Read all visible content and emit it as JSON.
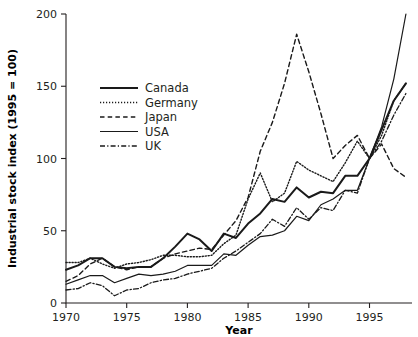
{
  "chart_data": {
    "type": "line",
    "title": "",
    "xlabel": "Year",
    "ylabel": "Industrial stock index (1995 = 100)",
    "xlim": [
      1970,
      1998.5
    ],
    "ylim": [
      0,
      200
    ],
    "xticks": [
      1970,
      1975,
      1980,
      1985,
      1990,
      1995
    ],
    "xtick_labels": [
      "1970",
      "1975",
      "1980",
      "1985",
      "1990",
      "1995"
    ],
    "yticks": [
      0,
      50,
      100,
      150,
      200
    ],
    "ytick_labels": [
      "0",
      "50",
      "100",
      "150",
      "200"
    ],
    "grid": false,
    "legend_position": "upper-left-inside",
    "x": [
      1970,
      1971,
      1972,
      1973,
      1974,
      1975,
      1976,
      1977,
      1978,
      1979,
      1980,
      1981,
      1982,
      1983,
      1984,
      1985,
      1986,
      1987,
      1988,
      1989,
      1990,
      1991,
      1992,
      1993,
      1994,
      1995,
      1996,
      1997,
      1998
    ],
    "series": [
      {
        "name": "Canada",
        "style": "solid-thick",
        "values": [
          23,
          26,
          31,
          31,
          25,
          24,
          25,
          25,
          31,
          39,
          48,
          44,
          36,
          48,
          45,
          55,
          62,
          72,
          70,
          80,
          73,
          77,
          76,
          88,
          88,
          100,
          120,
          140,
          152
        ]
      },
      {
        "name": "Germany",
        "style": "dotted",
        "values": [
          28,
          28,
          31,
          27,
          24,
          27,
          28,
          30,
          33,
          33,
          32,
          32,
          33,
          41,
          47,
          72,
          90,
          70,
          76,
          98,
          92,
          88,
          84,
          97,
          112,
          100,
          116,
          140,
          152
        ]
      },
      {
        "name": "Japan",
        "style": "dashed",
        "values": [
          15,
          19,
          27,
          31,
          25,
          23,
          25,
          25,
          31,
          34,
          36,
          38,
          37,
          47,
          57,
          73,
          105,
          125,
          152,
          186,
          160,
          131,
          100,
          109,
          116,
          100,
          110,
          93,
          87
        ]
      },
      {
        "name": "USA",
        "style": "solid",
        "values": [
          13,
          16,
          19,
          19,
          14,
          17,
          20,
          19,
          20,
          22,
          26,
          26,
          26,
          34,
          33,
          40,
          46,
          47,
          50,
          60,
          57,
          68,
          72,
          78,
          78,
          100,
          122,
          155,
          200
        ]
      },
      {
        "name": "UK",
        "style": "dash-dot",
        "values": [
          9,
          10,
          14,
          12,
          5,
          9,
          10,
          14,
          16,
          17,
          20,
          22,
          24,
          31,
          36,
          42,
          48,
          58,
          53,
          66,
          58,
          66,
          64,
          78,
          76,
          100,
          112,
          130,
          145
        ]
      }
    ]
  },
  "legend": {
    "items": [
      {
        "label": "Canada",
        "style": "solid-thick"
      },
      {
        "label": "Germany",
        "style": "dotted"
      },
      {
        "label": "Japan",
        "style": "dashed"
      },
      {
        "label": "USA",
        "style": "solid"
      },
      {
        "label": "UK",
        "style": "dash-dot"
      }
    ]
  },
  "colors": {
    "ink": "#231f20",
    "series": "#1a1a1a",
    "background": "#ffffff"
  }
}
